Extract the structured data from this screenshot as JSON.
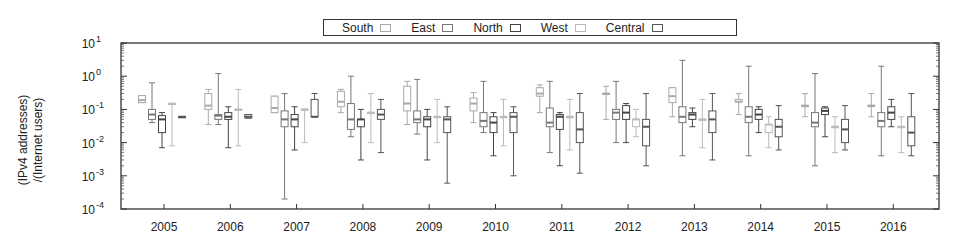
{
  "chart_data": {
    "type": "box",
    "title": "",
    "xlabel": "",
    "ylabel": "(IPv4 addresses) /(Internet users)",
    "ylabel_lines": [
      "(IPv4 addresses)",
      "/(Internet users)"
    ],
    "yscale": "log",
    "ylim": [
      0.0001,
      10
    ],
    "yticks": [
      "10^1",
      "10^0",
      "10^-1",
      "10^-2",
      "10^-3",
      "10^-4"
    ],
    "ytick_labels": [
      {
        "base": "10",
        "exp": "1"
      },
      {
        "base": "10",
        "exp": "0"
      },
      {
        "base": "10",
        "exp": "-1"
      },
      {
        "base": "10",
        "exp": "-2"
      },
      {
        "base": "10",
        "exp": "-3"
      },
      {
        "base": "10",
        "exp": "-4"
      }
    ],
    "categories": [
      "2005",
      "2006",
      "2007",
      "2008",
      "2009",
      "2010",
      "2011",
      "2012",
      "2013",
      "2014",
      "2015",
      "2016"
    ],
    "legend": {
      "position": "top",
      "entries": [
        "South",
        "East",
        "North",
        "West",
        "Central"
      ]
    },
    "series_colors": {
      "South": "#aaaaaa",
      "East": "#777777",
      "North": "#444444",
      "West": "#bbbbbb",
      "Central": "#555555"
    },
    "series": [
      {
        "name": "South",
        "boxes": [
          {
            "low": 0.16,
            "q1": 0.16,
            "median": 0.19,
            "q3": 0.26,
            "high": 0.26
          },
          {
            "low": 0.035,
            "q1": 0.1,
            "median": 0.13,
            "q3": 0.3,
            "high": 0.4
          },
          {
            "low": 0.08,
            "q1": 0.08,
            "median": 0.11,
            "q3": 0.25,
            "high": 0.25
          },
          {
            "low": 0.08,
            "q1": 0.12,
            "median": 0.17,
            "q3": 0.35,
            "high": 0.4
          },
          {
            "low": 0.035,
            "q1": 0.09,
            "median": 0.15,
            "q3": 0.5,
            "high": 0.7
          },
          {
            "low": 0.04,
            "q1": 0.09,
            "median": 0.15,
            "q3": 0.22,
            "high": 0.32
          },
          {
            "low": 0.08,
            "q1": 0.25,
            "median": 0.3,
            "q3": 0.45,
            "high": 0.55
          },
          {
            "low": 0.05,
            "q1": 0.28,
            "median": 0.3,
            "q3": 0.3,
            "high": 0.5
          },
          {
            "low": 0.06,
            "q1": 0.16,
            "median": 0.25,
            "q3": 0.45,
            "high": 0.45
          },
          {
            "low": 0.07,
            "q1": 0.17,
            "median": 0.17,
            "q3": 0.2,
            "high": 0.3
          },
          {
            "low": 0.06,
            "q1": 0.13,
            "median": 0.13,
            "q3": 0.13,
            "high": 0.3
          },
          {
            "low": 0.06,
            "q1": 0.13,
            "median": 0.13,
            "q3": 0.13,
            "high": 0.3
          }
        ]
      },
      {
        "name": "East",
        "boxes": [
          {
            "low": 0.04,
            "q1": 0.05,
            "median": 0.07,
            "q3": 0.1,
            "high": 0.63
          },
          {
            "low": 0.035,
            "q1": 0.05,
            "median": 0.065,
            "q3": 0.07,
            "high": 1.2
          },
          {
            "low": 0.0002,
            "q1": 0.03,
            "median": 0.05,
            "q3": 0.09,
            "high": 0.3
          },
          {
            "low": 0.015,
            "q1": 0.025,
            "median": 0.05,
            "q3": 0.15,
            "high": 1.0
          },
          {
            "low": 0.018,
            "q1": 0.04,
            "median": 0.05,
            "q3": 0.09,
            "high": 0.8
          },
          {
            "low": 0.02,
            "q1": 0.03,
            "median": 0.045,
            "q3": 0.08,
            "high": 0.7
          },
          {
            "low": 0.005,
            "q1": 0.03,
            "median": 0.04,
            "q3": 0.11,
            "high": 0.7
          },
          {
            "low": 0.01,
            "q1": 0.05,
            "median": 0.08,
            "q3": 0.1,
            "high": 0.7
          },
          {
            "low": 0.004,
            "q1": 0.04,
            "median": 0.06,
            "q3": 0.12,
            "high": 3.0
          },
          {
            "low": 0.004,
            "q1": 0.04,
            "median": 0.06,
            "q3": 0.12,
            "high": 2.0
          },
          {
            "low": 0.002,
            "q1": 0.03,
            "median": 0.04,
            "q3": 0.08,
            "high": 1.2
          },
          {
            "low": 0.004,
            "q1": 0.03,
            "median": 0.045,
            "q3": 0.08,
            "high": 2.0
          }
        ]
      },
      {
        "name": "North",
        "boxes": [
          {
            "low": 0.007,
            "q1": 0.02,
            "median": 0.05,
            "q3": 0.065,
            "high": 0.08
          },
          {
            "low": 0.007,
            "q1": 0.05,
            "median": 0.06,
            "q3": 0.08,
            "high": 0.12
          },
          {
            "low": 0.006,
            "q1": 0.03,
            "median": 0.05,
            "q3": 0.07,
            "high": 0.12
          },
          {
            "low": 0.003,
            "q1": 0.03,
            "median": 0.05,
            "q3": 0.05,
            "high": 0.1
          },
          {
            "low": 0.003,
            "q1": 0.03,
            "median": 0.05,
            "q3": 0.06,
            "high": 0.1
          },
          {
            "low": 0.004,
            "q1": 0.02,
            "median": 0.04,
            "q3": 0.06,
            "high": 0.08
          },
          {
            "low": 0.002,
            "q1": 0.025,
            "median": 0.06,
            "q3": 0.07,
            "high": 0.08
          },
          {
            "low": 0.01,
            "q1": 0.05,
            "median": 0.08,
            "q3": 0.13,
            "high": 0.15
          },
          {
            "low": 0.03,
            "q1": 0.05,
            "median": 0.07,
            "q3": 0.08,
            "high": 0.11
          },
          {
            "low": 0.02,
            "q1": 0.05,
            "median": 0.07,
            "q3": 0.1,
            "high": 0.12
          },
          {
            "low": 0.015,
            "q1": 0.07,
            "median": 0.09,
            "q3": 0.11,
            "high": 0.12
          },
          {
            "low": 0.03,
            "q1": 0.05,
            "median": 0.08,
            "q3": 0.12,
            "high": 0.2
          }
        ]
      },
      {
        "name": "West",
        "boxes": [
          {
            "low": 0.008,
            "q1": 0.15,
            "median": 0.15,
            "q3": 0.15,
            "high": 0.15
          },
          {
            "low": 0.008,
            "q1": 0.1,
            "median": 0.1,
            "q3": 0.1,
            "high": 0.4
          },
          {
            "low": 0.01,
            "q1": 0.1,
            "median": 0.1,
            "q3": 0.1,
            "high": 0.1
          },
          {
            "low": 0.01,
            "q1": 0.08,
            "median": 0.08,
            "q3": 0.08,
            "high": 0.3
          },
          {
            "low": 0.01,
            "q1": 0.06,
            "median": 0.06,
            "q3": 0.06,
            "high": 0.2
          },
          {
            "low": 0.008,
            "q1": 0.06,
            "median": 0.06,
            "q3": 0.06,
            "high": 0.2
          },
          {
            "low": 0.006,
            "q1": 0.06,
            "median": 0.06,
            "q3": 0.06,
            "high": 0.2
          },
          {
            "low": 0.015,
            "q1": 0.03,
            "median": 0.05,
            "q3": 0.05,
            "high": 0.1
          },
          {
            "low": 0.007,
            "q1": 0.05,
            "median": 0.05,
            "q3": 0.05,
            "high": 0.2
          },
          {
            "low": 0.007,
            "q1": 0.02,
            "median": 0.035,
            "q3": 0.035,
            "high": 0.06
          },
          {
            "low": 0.005,
            "q1": 0.03,
            "median": 0.03,
            "q3": 0.03,
            "high": 0.06
          },
          {
            "low": 0.005,
            "q1": 0.03,
            "median": 0.03,
            "q3": 0.03,
            "high": 0.06
          }
        ]
      },
      {
        "name": "Central",
        "boxes": [
          {
            "low": 0.06,
            "q1": 0.06,
            "median": 0.06,
            "q3": 0.06,
            "high": 0.06
          },
          {
            "low": 0.055,
            "q1": 0.055,
            "median": 0.06,
            "q3": 0.07,
            "high": 0.07
          },
          {
            "low": 0.06,
            "q1": 0.06,
            "median": 0.06,
            "q3": 0.2,
            "high": 0.3
          },
          {
            "low": 0.005,
            "q1": 0.05,
            "median": 0.07,
            "q3": 0.1,
            "high": 0.2
          },
          {
            "low": 0.0006,
            "q1": 0.02,
            "median": 0.05,
            "q3": 0.06,
            "high": 0.12
          },
          {
            "low": 0.001,
            "q1": 0.02,
            "median": 0.06,
            "q3": 0.08,
            "high": 0.12
          },
          {
            "low": 0.0012,
            "q1": 0.01,
            "median": 0.025,
            "q3": 0.08,
            "high": 0.3
          },
          {
            "low": 0.002,
            "q1": 0.008,
            "median": 0.03,
            "q3": 0.05,
            "high": 0.3
          },
          {
            "low": 0.003,
            "q1": 0.02,
            "median": 0.05,
            "q3": 0.09,
            "high": 0.3
          },
          {
            "low": 0.006,
            "q1": 0.015,
            "median": 0.03,
            "q3": 0.05,
            "high": 0.13
          },
          {
            "low": 0.006,
            "q1": 0.01,
            "median": 0.025,
            "q3": 0.05,
            "high": 0.13
          },
          {
            "low": 0.004,
            "q1": 0.008,
            "median": 0.02,
            "q3": 0.06,
            "high": 0.3
          }
        ]
      }
    ],
    "grid": false
  }
}
